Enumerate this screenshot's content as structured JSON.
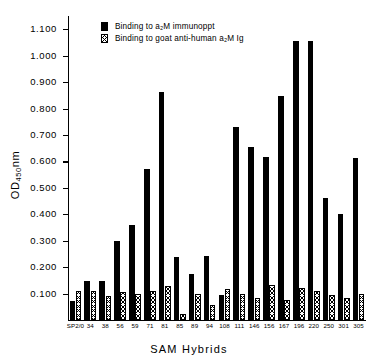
{
  "chart_data": {
    "type": "bar",
    "title": "",
    "xlabel": "SAM  Hybrids",
    "ylabel": "OD450nm",
    "ylabel_main": "OD",
    "ylabel_sub": "450",
    "ylabel_tail": "nm",
    "ylim": [
      0,
      1.15
    ],
    "grid": false,
    "legend_position": "top-center",
    "categories": [
      "SP2/0",
      "34",
      "38",
      "56",
      "59",
      "71",
      "81",
      "85",
      "89",
      "94",
      "108",
      "111",
      "146",
      "156",
      "167",
      "196",
      "220",
      "250",
      "301",
      "305"
    ],
    "yticks": [
      0.1,
      0.2,
      0.3,
      0.4,
      0.5,
      0.6,
      0.7,
      0.8,
      0.9,
      1.0,
      1.1
    ],
    "ytick_labels": [
      "0.100",
      "0.200",
      "0.300",
      "0.400",
      "0.500",
      "0.600",
      "0.700",
      "0.800",
      "0.900",
      "1.000",
      "1.100"
    ],
    "series": [
      {
        "name": "Binding to a2M immunoppt",
        "legend_label": "Binding to a₂M immunoppt",
        "pattern": "solid",
        "color": "#000000",
        "values": [
          0.072,
          0.147,
          0.148,
          0.3,
          0.359,
          0.571,
          0.864,
          0.237,
          0.173,
          0.241,
          0.093,
          0.729,
          0.656,
          0.616,
          0.847,
          1.056,
          1.057,
          0.461,
          0.402,
          0.614
        ]
      },
      {
        "name": "Binding to goat anti-human a2M Ig",
        "legend_label": "Binding to goat anti-human a₂M Ig",
        "pattern": "hatched",
        "color": "#000000",
        "values": [
          0.109,
          0.108,
          0.092,
          0.107,
          0.097,
          0.109,
          0.127,
          0.022,
          0.098,
          0.057,
          0.119,
          0.097,
          0.085,
          0.134,
          0.077,
          0.121,
          0.111,
          0.094,
          0.084,
          0.1
        ]
      }
    ]
  }
}
